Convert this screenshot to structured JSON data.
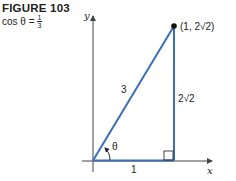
{
  "caption": {
    "title": "FIGURE 103",
    "equation_prefix": "cos θ =",
    "fraction_numerator": "1",
    "fraction_denominator": "3"
  },
  "diagram": {
    "axis_x_label": "x",
    "axis_y_label": "y",
    "point_label": "(1, 2√2)",
    "hypotenuse_label": "3",
    "opposite_label": "2√2",
    "adjacent_label": "1",
    "angle_label": "θ",
    "line_color": "#3a6fb5",
    "axis_color": "#444444"
  }
}
